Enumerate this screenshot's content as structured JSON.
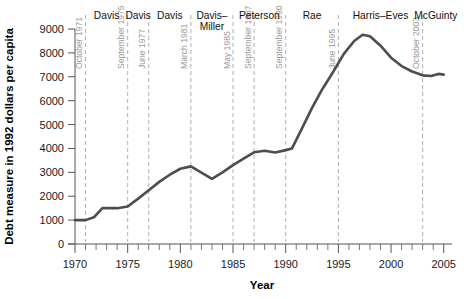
{
  "chart_data": {
    "type": "line",
    "title": "",
    "xlabel": "Year",
    "ylabel": "Debt measure in 1992 dollars per capita",
    "xlim": [
      1970,
      2005.5
    ],
    "ylim": [
      0,
      9000
    ],
    "grid": false,
    "legend_position": "none",
    "xticks": [
      1970,
      1975,
      1980,
      1985,
      1990,
      1995,
      2000,
      2005
    ],
    "xticklabels": [
      "1970",
      "1975",
      "1980",
      "1985",
      "1990",
      "1995",
      "2000",
      "2005"
    ],
    "xtick_minor_step": 1,
    "yticks": [
      0,
      1000,
      2000,
      3000,
      4000,
      5000,
      6000,
      7000,
      8000,
      9000
    ],
    "yticklabels": [
      "0",
      "1000",
      "2000",
      "3000",
      "4000",
      "5000",
      "6000",
      "7000",
      "8000",
      "9000"
    ],
    "series": [
      {
        "name": "Debt measure per capita",
        "color": "#4d4d4d",
        "x": [
          1970.0,
          1971.0,
          1971.8,
          1972.6,
          1974.0,
          1975.0,
          1976.0,
          1977.0,
          1978.0,
          1979.0,
          1980.0,
          1981.0,
          1982.0,
          1983.0,
          1984.0,
          1985.0,
          1986.0,
          1987.0,
          1988.0,
          1989.0,
          1990.0,
          1990.6,
          1991.5,
          1992.5,
          1993.5,
          1994.5,
          1995.5,
          1996.5,
          1997.3,
          1998.0,
          1999.0,
          2000.0,
          2001.0,
          2002.0,
          2003.0,
          2003.8,
          2004.5,
          2005.0
        ],
        "y": [
          1000,
          1000,
          1120,
          1500,
          1500,
          1570,
          1900,
          2250,
          2600,
          2900,
          3150,
          3250,
          2990,
          2730,
          3000,
          3300,
          3570,
          3840,
          3900,
          3830,
          3930,
          4000,
          4800,
          5700,
          6500,
          7200,
          7950,
          8500,
          8760,
          8700,
          8300,
          7800,
          7450,
          7220,
          7060,
          7030,
          7120,
          7090
        ]
      }
    ],
    "event_lines": [
      {
        "year": 1971.0,
        "date_label": "October 1971"
      },
      {
        "year": 1975.0,
        "date_label": "September 1975"
      },
      {
        "year": 1977.0,
        "date_label": "June 1977"
      },
      {
        "year": 1981.0,
        "date_label": "March 1981"
      },
      {
        "year": 1985.0,
        "date_label": "May 1985"
      },
      {
        "year": 1987.0,
        "date_label": "September 1987"
      },
      {
        "year": 1990.0,
        "date_label": "September 1990"
      },
      {
        "year": 1995.0,
        "date_label": "June 1995"
      },
      {
        "year": 2003.0,
        "date_label": "October 2003"
      }
    ],
    "period_labels": [
      {
        "label": "Davis",
        "start": 1971.0,
        "end": 1975.0
      },
      {
        "label": "Davis",
        "start": 1975.0,
        "end": 1977.0
      },
      {
        "label": "Davis",
        "start": 1977.0,
        "end": 1981.0
      },
      {
        "label": "Davis–\nMiller",
        "start": 1981.0,
        "end": 1985.0
      },
      {
        "label": "Peterson",
        "start": 1985.0,
        "end": 1990.0
      },
      {
        "label": "Rae",
        "start": 1990.0,
        "end": 1995.0
      },
      {
        "label": "Harris–Eves",
        "start": 1995.0,
        "end": 2003.0
      },
      {
        "label": "McGuinty",
        "start": 2003.0,
        "end": 2005.5
      }
    ],
    "colors": {
      "series": "#4d4d4d",
      "axis": "#555555",
      "event_line": "#b0b0b0",
      "date_label": "#9a9a9a",
      "background": "#ffffff"
    }
  }
}
